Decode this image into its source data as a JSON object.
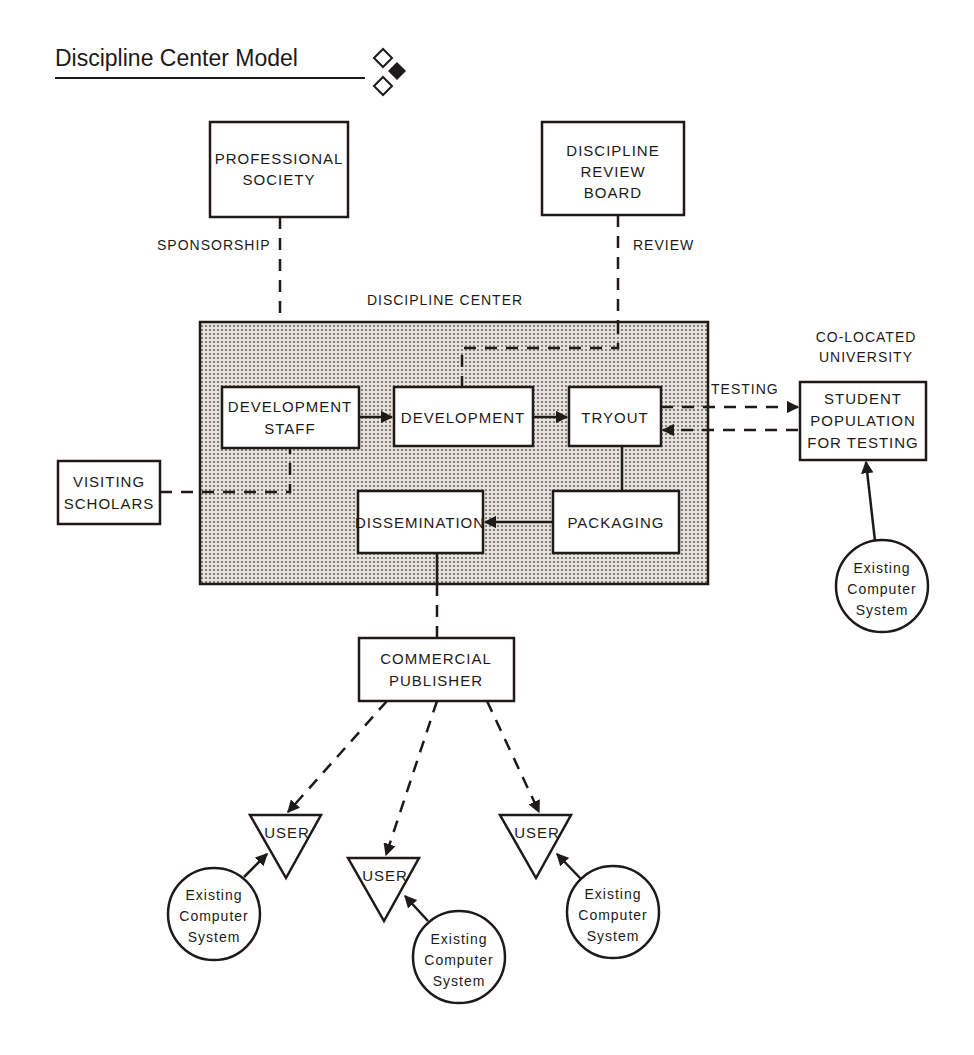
{
  "title": "Discipline Center Model",
  "colors": {
    "ink": "#1e1a17",
    "background": "#ffffff",
    "center_fill": "#c9c5c0"
  },
  "nodes": {
    "professional_society": [
      "PROFESSIONAL",
      "SOCIETY"
    ],
    "discipline_review_board": [
      "DISCIPLINE",
      "REVIEW",
      "BOARD"
    ],
    "discipline_center": "DISCIPLINE CENTER",
    "development_staff": [
      "DEVELOPMENT",
      "STAFF"
    ],
    "development": "DEVELOPMENT",
    "tryout": "TRYOUT",
    "packaging": "PACKAGING",
    "dissemination": "DISSEMINATION",
    "visiting_scholars": [
      "VISITING",
      "SCHOLARS"
    ],
    "co_located_university": [
      "CO-LOCATED",
      "UNIVERSITY"
    ],
    "student_population": [
      "STUDENT",
      "POPULATION",
      "FOR TESTING"
    ],
    "commercial_publisher": [
      "COMMERCIAL",
      "PUBLISHER"
    ],
    "users": [
      "USER",
      "USER",
      "USER"
    ],
    "existing_computer_system": [
      "Existing",
      "Computer",
      "System"
    ]
  },
  "edge_labels": {
    "sponsorship": "SPONSORSHIP",
    "review": "REVIEW",
    "testing": "TESTING"
  },
  "edges": [
    {
      "from": "PROFESSIONAL SOCIETY",
      "to": "DISCIPLINE CENTER",
      "style": "dashed",
      "label": "SPONSORSHIP"
    },
    {
      "from": "DISCIPLINE REVIEW BOARD",
      "to": "DEVELOPMENT",
      "style": "dashed",
      "label": "REVIEW"
    },
    {
      "from": "DEVELOPMENT STAFF",
      "to": "DEVELOPMENT",
      "style": "arrow"
    },
    {
      "from": "DEVELOPMENT",
      "to": "TRYOUT",
      "style": "arrow"
    },
    {
      "from": "TRYOUT",
      "to": "STUDENT POPULATION FOR TESTING",
      "style": "dashed-arrow",
      "label": "TESTING"
    },
    {
      "from": "STUDENT POPULATION FOR TESTING",
      "to": "TRYOUT",
      "style": "dashed-arrow"
    },
    {
      "from": "TRYOUT",
      "to": "PACKAGING",
      "style": "solid"
    },
    {
      "from": "PACKAGING",
      "to": "DISSEMINATION",
      "style": "arrow"
    },
    {
      "from": "VISITING SCHOLARS",
      "to": "DEVELOPMENT STAFF",
      "style": "dashed"
    },
    {
      "from": "DISSEMINATION",
      "to": "COMMERCIAL PUBLISHER",
      "style": "dashed"
    },
    {
      "from": "COMMERCIAL PUBLISHER",
      "to": "USER 1",
      "style": "dashed-arrow"
    },
    {
      "from": "COMMERCIAL PUBLISHER",
      "to": "USER 2",
      "style": "dashed-arrow"
    },
    {
      "from": "COMMERCIAL PUBLISHER",
      "to": "USER 3",
      "style": "dashed-arrow"
    },
    {
      "from": "Existing Computer System",
      "to": "STUDENT POPULATION FOR TESTING",
      "style": "arrow"
    },
    {
      "from": "Existing Computer System",
      "to": "USER 1",
      "style": "arrow"
    },
    {
      "from": "Existing Computer System",
      "to": "USER 2",
      "style": "arrow"
    },
    {
      "from": "Existing Computer System",
      "to": "USER 3",
      "style": "arrow"
    }
  ]
}
